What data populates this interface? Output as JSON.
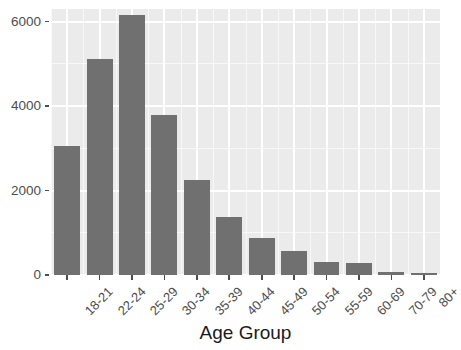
{
  "chart_data": {
    "type": "bar",
    "title": "",
    "subtitle": "",
    "xlabel": "Age Group",
    "ylabel": "",
    "categories": [
      "18-21",
      "22-24",
      "25-29",
      "30-34",
      "35-39",
      "40-44",
      "45-49",
      "50-54",
      "55-59",
      "60-69",
      "70-79",
      "80+"
    ],
    "values": [
      3050,
      5120,
      6150,
      3780,
      2250,
      1370,
      870,
      580,
      320,
      280,
      80,
      40
    ],
    "series": [
      {
        "name": "Count",
        "values": [
          3050,
          5120,
          6150,
          3780,
          2250,
          1370,
          870,
          580,
          320,
          280,
          80,
          40
        ]
      }
    ],
    "ylim": [
      0,
      6300
    ],
    "y_ticks": [
      0,
      2000,
      4000,
      6000
    ],
    "y_tick_labels": [
      "0",
      "2000",
      "4000",
      "6000"
    ],
    "y_minor_ticks": [
      1000,
      3000,
      5000,
      6000
    ],
    "grid": true,
    "legend": false,
    "legend_position": "none",
    "bar_color": "#707070",
    "panel_color": "#ebebeb",
    "grid_color": "#ffffff",
    "axis_text_color": "#4d4d4d",
    "title_color": "#1a1a1a",
    "x_tick_label_rotation": -45
  }
}
